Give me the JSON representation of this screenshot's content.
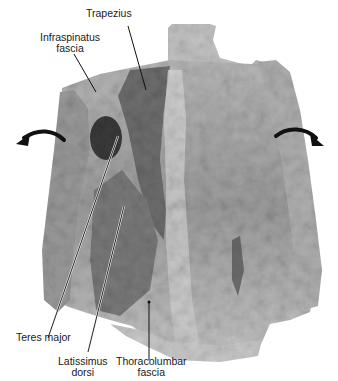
{
  "figure": {
    "labels": {
      "trapezius": "Trapezius",
      "infraspinatus_fascia": [
        "Infraspinatus",
        "fascia"
      ],
      "teres_major": "Teres major",
      "latissimus_dorsi": [
        "Latissimus",
        "dorsi"
      ],
      "thoracolumbar_fascia": [
        "Thoracolumbar",
        "fascia"
      ]
    },
    "icons": {
      "left_arrow": "curved-arrow-left",
      "right_arrow": "curved-arrow-right"
    },
    "colors": {
      "background": "#ffffff",
      "tissue_light": "#c9c9c9",
      "tissue_mid": "#8e8e8e",
      "tissue_dark": "#4a4a4a",
      "leader_line": "#111111",
      "text": "#1a1a1a"
    }
  }
}
